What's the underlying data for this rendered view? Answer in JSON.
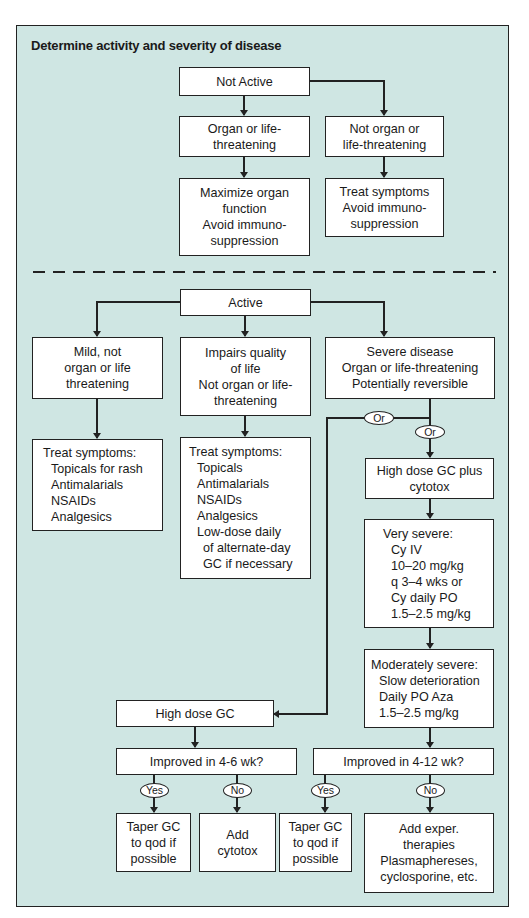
{
  "title": "Determine activity and severity of disease",
  "colors": {
    "panel_bg": "#cfe6e3",
    "box_bg": "#ffffff",
    "line": "#222222"
  },
  "not_active_section": {
    "root": "Not Active",
    "organ_threatening": {
      "lines": [
        "Organ or life-",
        "threatening"
      ]
    },
    "not_organ_threatening": {
      "lines": [
        "Not organ or",
        "life-threatening"
      ]
    },
    "organ_action": {
      "lines": [
        "Maximize organ",
        "function",
        "Avoid immuno-",
        "suppression"
      ]
    },
    "not_organ_action": {
      "lines": [
        "Treat symptoms",
        "Avoid immuno-",
        "suppression"
      ]
    }
  },
  "active_section": {
    "root": "Active",
    "mild": {
      "lines": [
        "Mild, not",
        "organ or life",
        "threatening"
      ]
    },
    "impairs": {
      "lines": [
        "Impairs quality",
        "of life",
        "Not organ or life-",
        "threatening"
      ]
    },
    "severe": {
      "lines": [
        "Severe disease",
        "Organ or life-threatening",
        "Potentially reversible"
      ]
    },
    "mild_action": {
      "lines": [
        "Treat symptoms:",
        "Topicals for rash",
        "Antimalarials",
        "NSAIDs",
        "Analgesics"
      ]
    },
    "impairs_action": {
      "lines": [
        "Treat symptoms:",
        "Topicals",
        "Antimalarials",
        "NSAIDs",
        "Analgesics",
        "Low-dose daily",
        "of alternate-day",
        "GC if necessary"
      ]
    },
    "or_label_1": "Or",
    "or_label_2": "Or",
    "high_dose_plus": {
      "lines": [
        "High dose GC plus",
        "cytotox"
      ]
    },
    "very_severe": {
      "lines": [
        "Very severe:",
        "Cy IV",
        "10–20 mg/kg",
        "q 3–4 wks or",
        "Cy daily PO",
        "1.5–2.5 mg/kg"
      ]
    },
    "moderately_severe": {
      "lines": [
        "Moderately severe:",
        "Slow deterioration",
        "Daily PO Aza",
        "1.5–2.5 mg/kg"
      ]
    },
    "high_dose_gc": "High dose GC",
    "improved_4_6": "Improved in 4-6 wk?",
    "improved_4_12": "Improved in 4-12 wk?",
    "yes_label_1": "Yes",
    "no_label_1": "No",
    "yes_label_2": "Yes",
    "no_label_2": "No",
    "taper_1": {
      "lines": [
        "Taper GC",
        "to qod if",
        "possible"
      ]
    },
    "add_cytotox": {
      "lines": [
        "Add",
        "cytotox"
      ]
    },
    "taper_2": {
      "lines": [
        "Taper GC",
        "to qod if",
        "possible"
      ]
    },
    "add_exper": {
      "lines": [
        "Add exper.",
        "therapies",
        "Plasmaphereses,",
        "cyclosporine, etc."
      ]
    }
  }
}
